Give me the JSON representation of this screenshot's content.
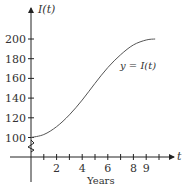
{
  "chart_data": {
    "type": "line",
    "title": "",
    "xlabel": "Years",
    "ylabel": "I(t)",
    "x_axis_symbol": "t",
    "curve_label": "y = I(t)",
    "x_ticks": [
      1,
      2,
      3,
      4,
      5,
      6,
      7,
      8,
      9,
      10
    ],
    "x_tick_labels": [
      "2",
      "4",
      "6",
      "8",
      "9"
    ],
    "x_tick_label_values": [
      2,
      4,
      6,
      8,
      9
    ],
    "y_ticks": [
      100,
      120,
      140,
      160,
      180,
      200
    ],
    "y_tick_labels": [
      "100",
      "120",
      "140",
      "160",
      "180",
      "200"
    ],
    "y_axis_break": true,
    "xlim": [
      0,
      10.3
    ],
    "ylim": [
      80,
      210
    ],
    "grid": false,
    "series": [
      {
        "name": "y = I(t)",
        "x": [
          0,
          1,
          2,
          3,
          4,
          5,
          6,
          7,
          8,
          9,
          9.7
        ],
        "values": [
          100,
          103,
          111,
          123,
          138,
          155,
          171,
          184,
          194,
          199,
          200
        ]
      }
    ]
  }
}
